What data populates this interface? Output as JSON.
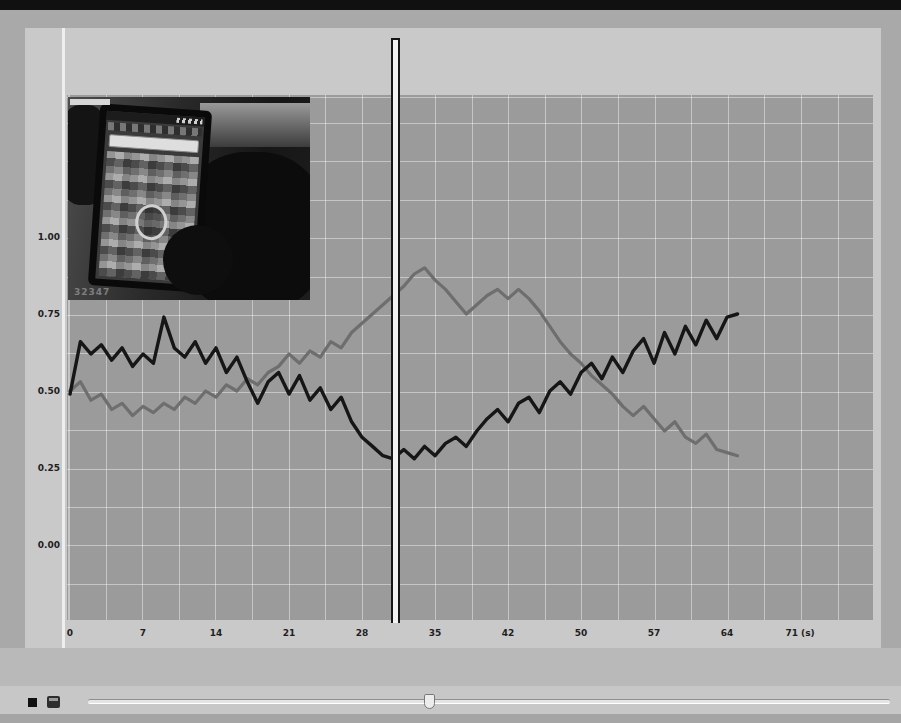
{
  "window": {
    "top_bar_color": "#101010",
    "background_color": "#a9a9a9"
  },
  "video_overlay": {
    "description": "hand-holding-smartphone-video-frame",
    "timestamp": "32347"
  },
  "chart_data": {
    "type": "line",
    "title": "",
    "xlabel": "(s)",
    "ylabel": "",
    "grid": true,
    "xlim": [
      0,
      77
    ],
    "ylim": [
      -0.24,
      1.46
    ],
    "x_tick_values": [
      0,
      7,
      14,
      21,
      28,
      35,
      42,
      50,
      57,
      64,
      71
    ],
    "x_tick_labels": [
      "0",
      "7",
      "14",
      "21",
      "28",
      "35",
      "42",
      "50",
      "57",
      "64",
      "71 (s)"
    ],
    "y_tick_values": [
      1.0,
      0.75,
      0.5,
      0.25,
      0.0
    ],
    "y_tick_labels": [
      "1.00",
      "0.75",
      "0.50",
      "0.25",
      "0.00"
    ],
    "cursor_time_s": 31,
    "t0": 0,
    "dt": 1,
    "series": [
      {
        "name": "Frustration",
        "color": "#6e6e6e",
        "values": [
          0.5,
          0.53,
          0.47,
          0.49,
          0.44,
          0.46,
          0.42,
          0.45,
          0.43,
          0.46,
          0.44,
          0.48,
          0.46,
          0.5,
          0.48,
          0.52,
          0.5,
          0.54,
          0.52,
          0.56,
          0.58,
          0.62,
          0.59,
          0.63,
          0.61,
          0.66,
          0.64,
          0.69,
          0.72,
          0.75,
          0.78,
          0.81,
          0.84,
          0.88,
          0.9,
          0.86,
          0.83,
          0.79,
          0.75,
          0.78,
          0.81,
          0.83,
          0.8,
          0.83,
          0.8,
          0.76,
          0.71,
          0.66,
          0.62,
          0.59,
          0.55,
          0.52,
          0.49,
          0.45,
          0.42,
          0.45,
          0.41,
          0.37,
          0.4,
          0.35,
          0.33,
          0.36,
          0.31,
          0.3,
          0.29
        ]
      },
      {
        "name": "Excitement",
        "color": "#161616",
        "values": [
          0.49,
          0.66,
          0.62,
          0.65,
          0.6,
          0.64,
          0.58,
          0.62,
          0.59,
          0.74,
          0.64,
          0.61,
          0.66,
          0.59,
          0.64,
          0.56,
          0.61,
          0.53,
          0.46,
          0.53,
          0.56,
          0.49,
          0.55,
          0.47,
          0.51,
          0.44,
          0.48,
          0.4,
          0.35,
          0.32,
          0.29,
          0.28,
          0.31,
          0.28,
          0.32,
          0.29,
          0.33,
          0.35,
          0.32,
          0.37,
          0.41,
          0.44,
          0.4,
          0.46,
          0.48,
          0.43,
          0.5,
          0.53,
          0.49,
          0.56,
          0.59,
          0.54,
          0.61,
          0.56,
          0.63,
          0.67,
          0.59,
          0.69,
          0.62,
          0.71,
          0.65,
          0.73,
          0.67,
          0.74,
          0.75
        ]
      }
    ]
  },
  "legend": {
    "items": [
      {
        "label": "Frustration",
        "color": "#6e6e6e"
      },
      {
        "label": "Excitement",
        "color": "#161616"
      }
    ]
  },
  "transport": {
    "stop_button": "stop",
    "clip_button": "media-clip",
    "slider_position_frac": 0.42
  },
  "plot_geometry": {
    "px_per_second": 10.43,
    "px_per_unit": 308,
    "zero_y_px": 450,
    "x_origin_px": 3
  }
}
